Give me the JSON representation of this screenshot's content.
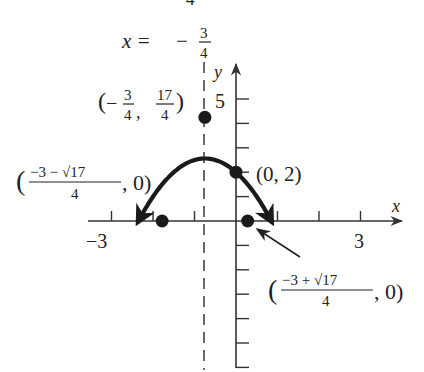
{
  "chart_data": {
    "type": "line",
    "title": "",
    "function": "y = -x^2 - 3/2 x + 2",
    "xlabel": "x",
    "ylabel": "y",
    "xlim": [
      -3.5,
      4
    ],
    "ylim": [
      -6,
      6
    ],
    "x_ticks": [
      -3,
      -2,
      -1,
      1,
      2,
      3
    ],
    "x_tick_labels": [
      {
        "value": -3,
        "text": "−3"
      },
      {
        "value": 3,
        "text": "3"
      }
    ],
    "y_ticks": [
      -6,
      -5,
      -4,
      -3,
      -2,
      -1,
      1,
      2,
      3,
      4,
      5
    ],
    "y_tick_labels": [
      {
        "value": 5,
        "text": "5"
      }
    ],
    "grid": false,
    "axis_of_symmetry": {
      "x": -0.75,
      "label_lhs": "x =",
      "label_sign": "−",
      "label_num": "3",
      "label_den": "4"
    },
    "points": [
      {
        "name": "vertex",
        "x": -0.75,
        "y": 4.25,
        "label_sign": "−",
        "label_x_num": "3",
        "label_x_den": "4",
        "label_y_num": "17",
        "label_y_den": "4"
      },
      {
        "name": "y-intercept",
        "x": 0,
        "y": 2,
        "label": "(0, 2)"
      },
      {
        "name": "left-x-intercept",
        "x": -1.7808,
        "y": 0,
        "label_num": "−3 − √17",
        "label_den": "4",
        "label_tail": ", 0)",
        "label_open": "("
      },
      {
        "name": "right-x-intercept",
        "x": 0.2808,
        "y": 0,
        "label_num": "−3 + √17",
        "label_den": "4",
        "label_tail": ", 0)",
        "label_open": "("
      }
    ],
    "series": [
      {
        "name": "parabola",
        "a": -1,
        "b": -1.5,
        "c": 2,
        "x_range": [
          -2.35,
          0.85
        ],
        "color": "#1a1a1a"
      }
    ],
    "colors": {
      "curve": "#1a1a1a",
      "axis": "#333333",
      "dash": "#444444"
    }
  },
  "fragments": {
    "top_cut_digit": "4"
  }
}
